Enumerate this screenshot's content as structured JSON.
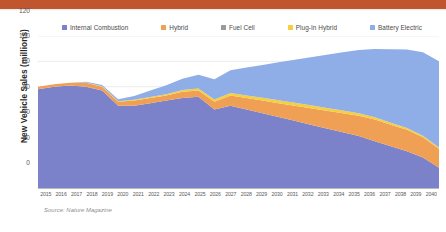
{
  "banner": {
    "accent_color": "#c1562e"
  },
  "legend": {
    "position": "top",
    "items": [
      {
        "label": "Internal Combustion",
        "color": "#7b82c9",
        "icon": "square-swatch-icon"
      },
      {
        "label": "Hybrid",
        "color": "#efa055",
        "icon": "square-swatch-icon"
      },
      {
        "label": "Fuel Cell",
        "color": "#9a9a9a",
        "icon": "square-swatch-icon"
      },
      {
        "label": "Plug-In Hybrid",
        "color": "#f5cf3f",
        "icon": "square-swatch-icon"
      },
      {
        "label": "Battery Electric",
        "color": "#8faee8",
        "icon": "square-swatch-icon"
      }
    ]
  },
  "axes": {
    "y_title": "New Vehicle Sales (millions)",
    "y_ticks": [
      "120",
      "100",
      "80",
      "60",
      "40",
      "20",
      "0"
    ],
    "y_min": 0,
    "y_max": 120
  },
  "source": {
    "text": "Source: Nature Magazine"
  },
  "chart_data": {
    "type": "area",
    "title": "",
    "subtitle": "",
    "xlabel": "",
    "ylabel": "New Vehicle Sales (millions)",
    "ylim": [
      0,
      120
    ],
    "grid": true,
    "legend_position": "top",
    "stacked": true,
    "annotations": [
      "Source: Nature Magazine"
    ],
    "categories": [
      "2015",
      "2016",
      "2017",
      "2018",
      "2019",
      "2020",
      "2021",
      "2022",
      "2023",
      "2024",
      "2025",
      "2026",
      "2027",
      "2028",
      "2029",
      "2030",
      "2031",
      "2032",
      "2033",
      "2034",
      "2035",
      "2036",
      "2037",
      "2038",
      "2039",
      "2040"
    ],
    "series": [
      {
        "name": "Internal Combustion",
        "color": "#7b82c9",
        "values": [
          78,
          80,
          81,
          80,
          77,
          65,
          65,
          67,
          69,
          71,
          72,
          62,
          65,
          62,
          59,
          56,
          53,
          50,
          47,
          44,
          41,
          37,
          33,
          29,
          24,
          16
        ]
      },
      {
        "name": "Hybrid",
        "color": "#efa055",
        "values": [
          2,
          2,
          2,
          3,
          3,
          3,
          4,
          4,
          4,
          5,
          5,
          6,
          8,
          9,
          10,
          11,
          12,
          13,
          14,
          15,
          16,
          17,
          17,
          17,
          16,
          15
        ]
      },
      {
        "name": "Fuel Cell",
        "color": "#9a9a9a",
        "values": [
          0,
          0,
          0,
          0,
          0,
          0,
          0,
          0,
          0,
          0,
          0,
          0,
          0,
          0,
          0,
          0,
          0,
          0,
          0,
          0,
          0,
          0,
          0,
          0,
          0,
          0
        ]
      },
      {
        "name": "Plug-In Hybrid",
        "color": "#f5cf3f",
        "values": [
          0,
          0,
          0,
          0.3,
          0.4,
          0.5,
          0.7,
          0.9,
          1.1,
          1.3,
          1.5,
          1.8,
          2.0,
          2.1,
          2.2,
          2.3,
          2.3,
          2.3,
          2.2,
          2.1,
          2.0,
          1.8,
          1.6,
          1.4,
          1.2,
          1.0
        ]
      },
      {
        "name": "Battery Electric",
        "color": "#8faee8",
        "values": [
          0,
          0,
          0,
          0.5,
          1,
          1.5,
          3,
          5,
          7,
          9,
          11,
          16,
          18,
          22,
          26,
          30,
          34,
          38,
          42,
          46,
          50,
          54,
          58,
          62,
          66,
          68
        ]
      }
    ],
    "totals": [
      80,
      82,
      83,
      83.8,
      81.4,
      70,
      72.7,
      76.9,
      81.1,
      86.3,
      89.5,
      85.8,
      93,
      95.1,
      97.2,
      99.3,
      101.3,
      103.3,
      105.2,
      107.1,
      109,
      109.8,
      109.6,
      109.4,
      107.2,
      100
    ]
  }
}
